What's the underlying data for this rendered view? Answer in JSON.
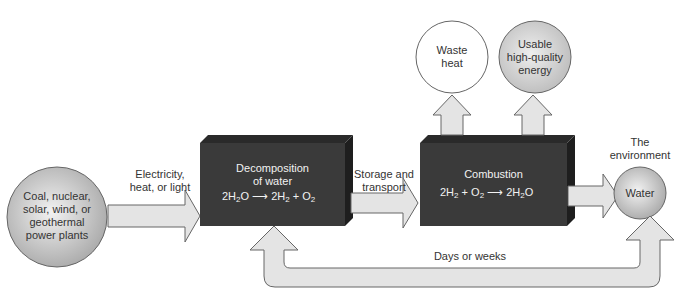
{
  "diagram": {
    "type": "flow",
    "source": {
      "label_lines": [
        "Coal, nuclear,",
        "solar, wind, or",
        "geothermal",
        "power plants"
      ]
    },
    "arrow_energy": {
      "label_lines": [
        "Electricity,",
        "heat, or light"
      ]
    },
    "decomposition_box": {
      "title_lines": [
        "Decomposition",
        "of water"
      ],
      "equation": {
        "lhs": "2H",
        "lhs_sub": "2",
        "lhs_tail": "O",
        "rhs1": "2H",
        "rhs1_sub": "2",
        "plus": "+",
        "rhs2": "O",
        "rhs2_sub": "2"
      }
    },
    "arrow_storage": {
      "label_lines": [
        "Storage and",
        "transport"
      ]
    },
    "combustion_box": {
      "title": "Combustion",
      "equation": {
        "lhs1": "2H",
        "lhs1_sub": "2",
        "plus": "+",
        "lhs2": "O",
        "lhs2_sub": "2",
        "rhs": "2H",
        "rhs_sub": "2",
        "rhs_tail": "O"
      }
    },
    "outputs": [
      {
        "label_lines": [
          "Waste",
          "heat"
        ]
      },
      {
        "label_lines": [
          "Usable",
          "high-quality",
          "energy"
        ]
      }
    ],
    "environment": {
      "label_lines": [
        "The",
        "environment"
      ],
      "node": "Water"
    },
    "return_arrow": {
      "label": "Days or weeks"
    },
    "colors": {
      "box": "#3a3a3a",
      "arrow_fill": "#e4e4e4",
      "arrow_stroke": "#666666",
      "circle_gray": "#c8c8c8"
    }
  }
}
